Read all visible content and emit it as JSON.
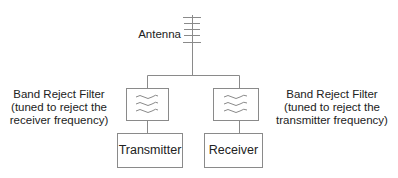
{
  "diagram": {
    "antenna": {
      "label": "Antenna"
    },
    "left_filter": {
      "lines": [
        "Band Reject Filter",
        "(tuned to reject the",
        "receiver frequency)"
      ]
    },
    "right_filter": {
      "lines": [
        "Band Reject Filter",
        "(tuned to reject the",
        "transmitter frequency)"
      ]
    },
    "transmitter": {
      "label": "Transmitter"
    },
    "receiver": {
      "label": "Receiver"
    },
    "colors": {
      "line": "#8a8a8a",
      "text": "#222222"
    }
  }
}
